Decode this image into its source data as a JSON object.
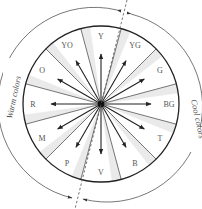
{
  "diagram": {
    "type": "color-wheel",
    "center": [
      101,
      104
    ],
    "inner_radius": 78,
    "arc_radius": 95,
    "segments": [
      {
        "label": "Y",
        "angle": 0
      },
      {
        "label": "YG",
        "angle": 30
      },
      {
        "label": "G",
        "angle": 60
      },
      {
        "label": "BG",
        "angle": 90
      },
      {
        "label": "T",
        "angle": 120
      },
      {
        "label": "B",
        "angle": 150
      },
      {
        "label": "V",
        "angle": 180
      },
      {
        "label": "P",
        "angle": 210
      },
      {
        "label": "M",
        "angle": 240
      },
      {
        "label": "R",
        "angle": 270
      },
      {
        "label": "O",
        "angle": 300
      },
      {
        "label": "YO",
        "angle": 330
      }
    ],
    "warm_label": "Warm colors",
    "cool_label": "Cool colors",
    "colors": {
      "stroke": "#222222",
      "divider": "#666666",
      "shade": "#d8d8d8",
      "text": "#555555",
      "arc": "#555555"
    }
  }
}
